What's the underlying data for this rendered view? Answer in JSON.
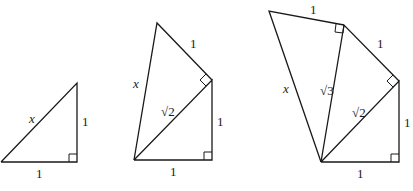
{
  "figures": [
    {
      "name": "triangle-1",
      "labels": {
        "hyp": "x",
        "leg_vertical": "1",
        "leg_bottom": "1"
      }
    },
    {
      "name": "triangle-2",
      "labels": {
        "hyp": "x",
        "top_leg": "1",
        "diag": "√2",
        "leg_vertical": "1",
        "leg_bottom": "1"
      }
    },
    {
      "name": "triangle-3",
      "labels": {
        "hyp": "x",
        "top_leg": "1",
        "mid_leg": "1",
        "diag3": "√3",
        "diag2": "√2",
        "leg_vertical": "1",
        "leg_bottom": "1"
      }
    }
  ]
}
